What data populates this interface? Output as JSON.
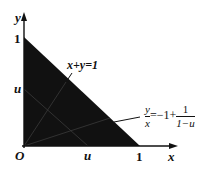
{
  "diagram": {
    "type": "math-region",
    "colors": {
      "fill": "#111111",
      "axis": "#111111",
      "background": "#ffffff",
      "internal_lines": "#2a2a2a"
    },
    "axes": {
      "x_label": "x",
      "y_label": "y",
      "origin_label": "O"
    },
    "ticks": {
      "x_one": "1",
      "y_one": "1",
      "x_u": "u",
      "y_u": "u"
    },
    "labels": {
      "line1": "x+y=1",
      "line2_lhs_num": "y",
      "line2_lhs_den": "x",
      "line2_mid": "=−1+",
      "line2_rhs_num": "1",
      "line2_rhs_den": "1−u"
    },
    "region": {
      "vertices": [
        [
          0,
          0
        ],
        [
          1,
          0
        ],
        [
          0,
          1
        ]
      ],
      "filled": true
    },
    "lines": [
      {
        "name": "x+y=1",
        "from": [
          0,
          1
        ],
        "to": [
          1,
          0
        ]
      },
      {
        "name": "x+y=u",
        "from": [
          0,
          "u"
        ],
        "to": [
          "u",
          0
        ]
      },
      {
        "name": "y/x = -1 + 1/(1-u)",
        "from": [
          0,
          0
        ],
        "to_boundary": "x+y=1"
      }
    ]
  }
}
